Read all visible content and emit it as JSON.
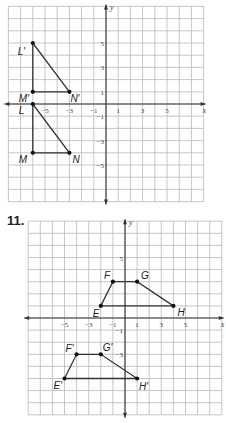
{
  "graphs": [
    {
      "id": "graph-1",
      "problem_number": "",
      "origin_px": [
        106,
        104
      ],
      "cell_px": 12.2,
      "extent": {
        "xmin": -8,
        "xmax": 8,
        "ymin": -8,
        "ymax": 8
      },
      "axis_labels": {
        "x": "x",
        "y": "y"
      },
      "x_ticks": [
        {
          "value": -5,
          "label": "−5"
        },
        {
          "value": -3,
          "label": "−3"
        },
        {
          "value": -1,
          "label": "−1"
        },
        {
          "value": 1,
          "label": "1"
        },
        {
          "value": 3,
          "label": "3"
        },
        {
          "value": 5,
          "label": "5"
        }
      ],
      "y_ticks": [
        {
          "value": 5,
          "label": "5"
        },
        {
          "value": 3,
          "label": "3"
        },
        {
          "value": 1,
          "label": "1"
        },
        {
          "value": -1,
          "label": "−1"
        },
        {
          "value": -3,
          "label": "−3"
        },
        {
          "value": -5,
          "label": "−5"
        }
      ],
      "shapes": [
        {
          "name": "triangle-LMN",
          "points": [
            {
              "label": "L",
              "x": -6,
              "y": 0,
              "label_dx": -14,
              "label_dy": 10
            },
            {
              "label": "M",
              "x": -6,
              "y": -4,
              "label_dx": -14,
              "label_dy": 10
            },
            {
              "label": "N",
              "x": -3,
              "y": -4,
              "label_dx": 3,
              "label_dy": 10
            }
          ]
        },
        {
          "name": "triangle-LMN-prime",
          "points": [
            {
              "label": "L′",
              "x": -6,
              "y": 5,
              "label_dx": -15,
              "label_dy": 12
            },
            {
              "label": "M′",
              "x": -6,
              "y": 1,
              "label_dx": -14,
              "label_dy": 10
            },
            {
              "label": "N′",
              "x": -3,
              "y": 1,
              "label_dx": 1,
              "label_dy": 10
            }
          ]
        }
      ]
    },
    {
      "id": "graph-2",
      "problem_number": "11.",
      "origin_px": [
        125,
        318
      ],
      "cell_px": 12.1,
      "extent": {
        "xmin": -8,
        "xmax": 8,
        "ymin": -8,
        "ymax": 8
      },
      "axis_labels": {
        "x": "x",
        "y": "y"
      },
      "x_ticks": [
        {
          "value": -5,
          "label": "−5"
        },
        {
          "value": -3,
          "label": "−3"
        },
        {
          "value": -1,
          "label": "−1"
        },
        {
          "value": 1,
          "label": "1"
        },
        {
          "value": 3,
          "label": "3"
        },
        {
          "value": 5,
          "label": "5"
        }
      ],
      "y_ticks": [
        {
          "value": 5,
          "label": "5"
        },
        {
          "value": -1,
          "label": "−1"
        },
        {
          "value": -3,
          "label": "−3"
        }
      ],
      "shapes": [
        {
          "name": "quadrilateral-EFGH",
          "points": [
            {
              "label": "E",
              "x": -2,
              "y": 1,
              "label_dx": -8,
              "label_dy": 11
            },
            {
              "label": "F",
              "x": -1,
              "y": 3,
              "label_dx": -9,
              "label_dy": -3
            },
            {
              "label": "G",
              "x": 1,
              "y": 3,
              "label_dx": 4,
              "label_dy": -3
            },
            {
              "label": "H",
              "x": 4,
              "y": 1,
              "label_dx": 4,
              "label_dy": 10
            }
          ]
        },
        {
          "name": "quadrilateral-EFGH-prime",
          "points": [
            {
              "label": "E′",
              "x": -5,
              "y": -5,
              "label_dx": -11,
              "label_dy": 10
            },
            {
              "label": "F′",
              "x": -4,
              "y": -3,
              "label_dx": -11,
              "label_dy": -2
            },
            {
              "label": "G′",
              "x": -2,
              "y": -3,
              "label_dx": 2,
              "label_dy": -3
            },
            {
              "label": "H′",
              "x": 1,
              "y": -5,
              "label_dx": 2,
              "label_dy": 11
            }
          ]
        }
      ]
    }
  ],
  "chart_data": [
    {
      "type": "scatter",
      "title": "",
      "xlabel": "x",
      "ylabel": "y",
      "xlim": [
        -8,
        8
      ],
      "ylim": [
        -8,
        8
      ],
      "grid": true,
      "series": [
        {
          "name": "Triangle LMN",
          "closed": true,
          "points": [
            {
              "label": "L",
              "x": -6,
              "y": 0
            },
            {
              "label": "M",
              "x": -6,
              "y": -4
            },
            {
              "label": "N",
              "x": -3,
              "y": -4
            }
          ]
        },
        {
          "name": "Triangle L′M′N′",
          "closed": true,
          "points": [
            {
              "label": "L′",
              "x": -6,
              "y": 5
            },
            {
              "label": "M′",
              "x": -6,
              "y": 1
            },
            {
              "label": "N′",
              "x": -3,
              "y": 1
            }
          ]
        }
      ],
      "x_tick_labels": [
        "−5",
        "−3",
        "−1",
        "1",
        "3",
        "5"
      ],
      "y_tick_labels": [
        "5",
        "3",
        "1",
        "−1",
        "−3",
        "−5"
      ]
    },
    {
      "type": "scatter",
      "title": "11.",
      "xlabel": "x",
      "ylabel": "y",
      "xlim": [
        -8,
        8
      ],
      "ylim": [
        -8,
        8
      ],
      "grid": true,
      "series": [
        {
          "name": "Quadrilateral EFGH",
          "closed": true,
          "points": [
            {
              "label": "E",
              "x": -2,
              "y": 1
            },
            {
              "label": "F",
              "x": -1,
              "y": 3
            },
            {
              "label": "G",
              "x": 1,
              "y": 3
            },
            {
              "label": "H",
              "x": 4,
              "y": 1
            }
          ]
        },
        {
          "name": "Quadrilateral E′F′G′H′",
          "closed": true,
          "points": [
            {
              "label": "E′",
              "x": -5,
              "y": -5
            },
            {
              "label": "F′",
              "x": -4,
              "y": -3
            },
            {
              "label": "G′",
              "x": -2,
              "y": -3
            },
            {
              "label": "H′",
              "x": 1,
              "y": -5
            }
          ]
        }
      ],
      "x_tick_labels": [
        "−5",
        "−3",
        "−1",
        "1",
        "3",
        "5"
      ],
      "y_tick_labels": [
        "5",
        "−1",
        "−3"
      ]
    }
  ]
}
